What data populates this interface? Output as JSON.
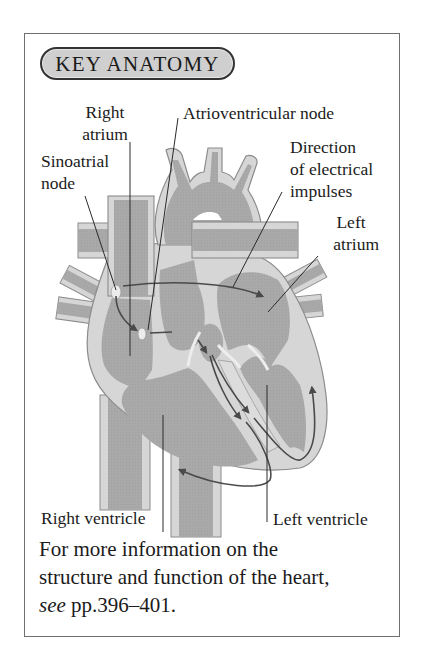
{
  "panel": {
    "badge_label": "KEY ANATOMY"
  },
  "labels": {
    "right_atrium_line1": "Right",
    "right_atrium_line2": "atrium",
    "av_node": "Atrioventricular node",
    "direction_line1": "Direction",
    "direction_line2": "of electrical",
    "direction_line3": "impulses",
    "sinoatrial_line1": "Sinoatrial",
    "sinoatrial_line2": "node",
    "left_atrium_line1": "Left",
    "left_atrium_line2": "atrium",
    "right_ventricle": "Right ventricle",
    "left_ventricle": "Left ventricle"
  },
  "footer": {
    "line1": "For more information on the",
    "line2": "structure and function of the heart,",
    "see_word": "see",
    "page_ref": " pp.396–401."
  },
  "colors": {
    "chamber": "#a9a9a9",
    "wall": "#d6d6d6",
    "outline": "#8c8c8c",
    "arrow": "#4a4a4a",
    "badge_fill": "#cfcfcf"
  }
}
